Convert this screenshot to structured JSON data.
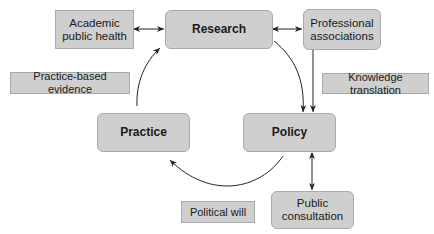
{
  "diagram": {
    "main_nodes": {
      "research": "Research",
      "practice": "Practice",
      "policy": "Policy"
    },
    "side_nodes": {
      "academic_public_health": "Academic\npublic health",
      "professional_associations": "Professional\nassociations",
      "public_consultation": "Public\nconsultation"
    },
    "edge_labels": {
      "practice_based_evidence": "Practice-based evidence",
      "knowledge_translation": "Knowledge translation",
      "political_will": "Political will"
    },
    "edges": [
      {
        "from": "Academic public health",
        "to": "Research",
        "type": "bidirectional"
      },
      {
        "from": "Research",
        "to": "Professional associations",
        "type": "bidirectional"
      },
      {
        "from": "Research",
        "to": "Policy",
        "type": "curved-arrow"
      },
      {
        "from": "Professional associations",
        "to": "Policy",
        "type": "arrow",
        "label": "Knowledge translation"
      },
      {
        "from": "Policy",
        "to": "Practice",
        "type": "curved-arrow",
        "label": "Political will"
      },
      {
        "from": "Practice",
        "to": "Research",
        "type": "curved-arrow",
        "label": "Practice-based evidence"
      },
      {
        "from": "Policy",
        "to": "Public consultation",
        "type": "bidirectional"
      }
    ],
    "colors": {
      "box_fill": "#cfcfcf",
      "box_border": "#a9a9a9",
      "line": "#222222"
    }
  }
}
